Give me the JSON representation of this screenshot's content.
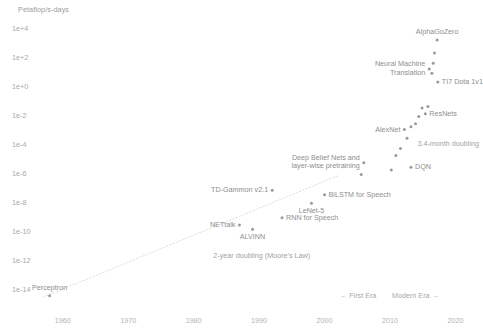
{
  "chart_data": {
    "type": "scatter",
    "title": "",
    "ylabel": "Petaflop/s-days",
    "xlabel": "",
    "xlim": [
      1955,
      2021
    ],
    "ylim": [
      -15,
      5
    ],
    "yscale": "log",
    "grid": false,
    "legend_position": "none",
    "yticks": [
      "1e+4",
      "1e+2",
      "1e+0",
      "1e-2",
      "1e-4",
      "1e-6",
      "1e-8",
      "1e-10",
      "1e-12",
      "1e-14"
    ],
    "ytick_values": [
      4,
      2,
      0,
      -2,
      -4,
      -6,
      -8,
      -10,
      -12,
      -14
    ],
    "xticks": [
      "1960",
      "1970",
      "1980",
      "1990",
      "2000",
      "2010",
      "2020"
    ],
    "xtick_values": [
      1960,
      1970,
      1980,
      1990,
      2000,
      2010,
      2020
    ],
    "points": [
      {
        "label": "Perceptron",
        "x": 1958.0,
        "y": -14.5,
        "side": "up"
      },
      {
        "label": "NETtalk",
        "x": 1987.0,
        "y": -9.6,
        "side": "left"
      },
      {
        "label": "ALVINN",
        "x": 1989.0,
        "y": -9.9,
        "side": "down"
      },
      {
        "label": "TD-Gammon v2.1",
        "x": 1992.0,
        "y": -7.2,
        "side": "left"
      },
      {
        "label": "RNN for Speech",
        "x": 1993.5,
        "y": -9.1,
        "side": "right"
      },
      {
        "label": "LeNet-5",
        "x": 1998.0,
        "y": -8.1,
        "side": "down"
      },
      {
        "label": "BiLSTM for Speech",
        "x": 2000.0,
        "y": -7.5,
        "side": "right"
      },
      {
        "label": "Deep Belief Nets and\nlayer-wise pretraining",
        "x": 2006.0,
        "y": -5.3,
        "side": "left"
      },
      {
        "label": "DQN",
        "x": 2013.2,
        "y": -5.6,
        "side": "right"
      },
      {
        "label": "AlexNet",
        "x": 2012.2,
        "y": -3.0,
        "side": "left"
      },
      {
        "label": "ResNets",
        "x": 2015.4,
        "y": -1.9,
        "side": "right"
      },
      {
        "label": "Neural Machine\nTranslation",
        "x": 2016.0,
        "y": 1.2,
        "side": "left"
      },
      {
        "label": "TI7 Dota 1v1",
        "x": 2017.3,
        "y": 0.3,
        "side": "right"
      },
      {
        "label": "AlphaGoZero",
        "x": 2017.2,
        "y": 3.2,
        "side": "up"
      },
      {
        "label": "",
        "x": 2010.2,
        "y": -5.8,
        "side": ""
      },
      {
        "label": "",
        "x": 2010.9,
        "y": -4.8,
        "side": ""
      },
      {
        "label": "",
        "x": 2011.6,
        "y": -4.3,
        "side": ""
      },
      {
        "label": "",
        "x": 2012.6,
        "y": -3.6,
        "side": ""
      },
      {
        "label": "",
        "x": 2013.2,
        "y": -2.8,
        "side": ""
      },
      {
        "label": "",
        "x": 2013.9,
        "y": -2.6,
        "side": ""
      },
      {
        "label": "",
        "x": 2014.4,
        "y": -2.1,
        "side": ""
      },
      {
        "label": "",
        "x": 2014.9,
        "y": -1.5,
        "side": ""
      },
      {
        "label": "",
        "x": 2015.8,
        "y": -1.4,
        "side": ""
      },
      {
        "label": "",
        "x": 2016.4,
        "y": 0.9,
        "side": ""
      },
      {
        "label": "",
        "x": 2016.6,
        "y": 1.6,
        "side": ""
      },
      {
        "label": "",
        "x": 2016.8,
        "y": 2.3,
        "side": ""
      },
      {
        "label": "",
        "x": 2005.6,
        "y": -6.1,
        "side": ""
      }
    ],
    "annotations": [
      {
        "id": "moores-law",
        "text": "2-year doubling (Moore's Law)",
        "x": 1983.0,
        "y": -11.7
      },
      {
        "id": "modern-doubling",
        "text": "3.4-month doubling",
        "x": 2014.2,
        "y": -3.9
      }
    ],
    "trendlines": [
      {
        "id": "moores-law-line",
        "style": "dotted",
        "x1": 1957.0,
        "y1": -14.6,
        "x2": 2002.0,
        "y2": -6.2
      }
    ],
    "era_markers": {
      "first_era": "← First Era",
      "modern_era": "Modern Era →"
    }
  }
}
